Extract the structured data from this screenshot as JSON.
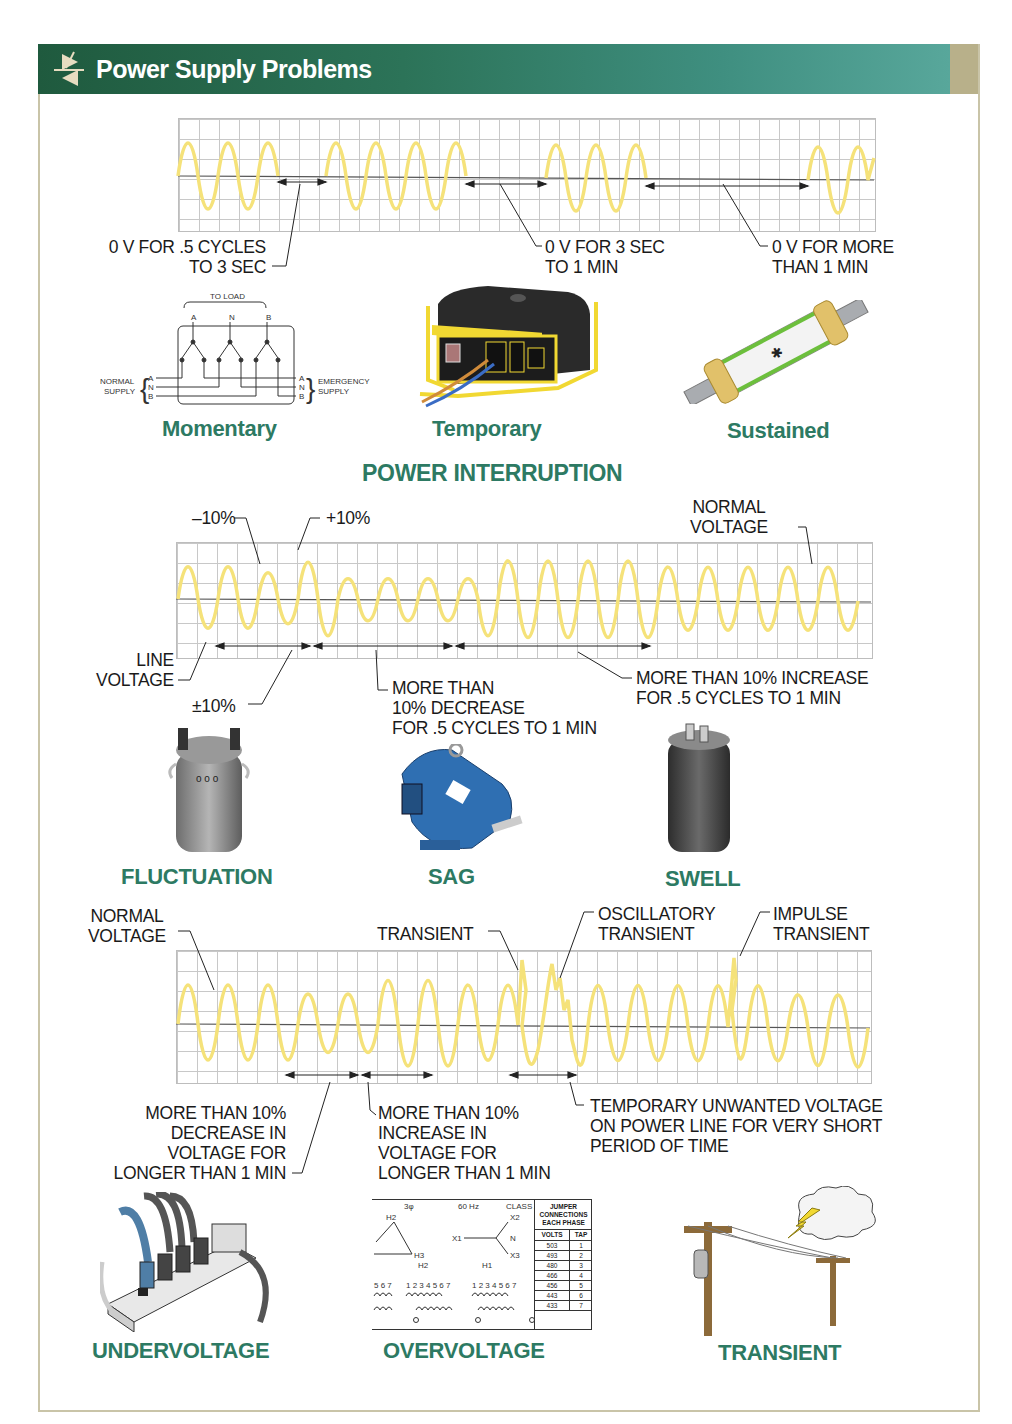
{
  "header": {
    "title": "Power Supply Problems",
    "icon": "thyristor-symbol-icon",
    "gradient_colors": [
      "#1f5a3e",
      "#58a79b"
    ],
    "accent_text_color": "#2d7a63",
    "waveform_color": "#f5e27a"
  },
  "interruption": {
    "annotations": {
      "momentary": "0 V FOR .5 CYCLES\nTO 3 SEC",
      "temporary": "0 V FOR 3 SEC\nTO 1 MIN",
      "sustained": "0 V FOR MORE\nTHAN 1 MIN"
    },
    "transfer_switch": {
      "to_load": "TO LOAD",
      "load_terminals": [
        "A",
        "N",
        "B"
      ],
      "normal_supply": "NORMAL\nSUPPLY",
      "emergency_supply": "EMERGENCY\nSUPPLY",
      "supply_terminals": [
        "A",
        "N",
        "B"
      ]
    },
    "captions": {
      "momentary": "Momentary",
      "temporary": "Temporary",
      "sustained": "Sustained"
    },
    "section_title": "POWER INTERRUPTION"
  },
  "voltage_variation": {
    "annotations": {
      "minus10": "–10%",
      "plus10": "+10%",
      "normal_voltage": "NORMAL\nVOLTAGE",
      "line_voltage": "LINE\nVOLTAGE",
      "plus_minus10": "±10%",
      "decrease": "MORE THAN\n10% DECREASE\nFOR .5 CYCLES TO 1 MIN",
      "increase": "MORE THAN 10% INCREASE\nFOR .5 CYCLES TO 1 MIN"
    },
    "captions": {
      "fluctuation": "FLUCTUATION",
      "sag": "SAG",
      "swell": "SWELL"
    }
  },
  "long_duration": {
    "annotations": {
      "normal_voltage": "NORMAL\nVOLTAGE",
      "transient": "TRANSIENT",
      "oscillatory": "OSCILLATORY\nTRANSIENT",
      "impulse": "IMPULSE\nTRANSIENT",
      "undervoltage_desc": "MORE THAN 10%\nDECREASE IN\nVOLTAGE FOR\nLONGER THAN 1 MIN",
      "overvoltage_desc": "MORE THAN 10%\nINCREASE IN\nVOLTAGE FOR\nLONGER THAN 1 MIN",
      "transient_desc": "TEMPORARY UNWANTED VOLTAGE\nON POWER LINE FOR VERY SHORT\nPERIOD OF TIME"
    },
    "nameplate": {
      "phase": "3φ",
      "frequency": "60 Hz",
      "class": "CLASS AA",
      "primary_terminals": [
        "H2",
        "H3"
      ],
      "secondary_terminals": [
        "X1",
        "X2",
        "X3",
        "N"
      ],
      "jumper_header": "JUMPER\nCONNECTIONS\nEACH PHASE",
      "col_volts": "VOLTS",
      "col_tap": "TAP",
      "rows": [
        {
          "volts": "503",
          "tap": "1"
        },
        {
          "volts": "493",
          "tap": "2"
        },
        {
          "volts": "480",
          "tap": "3"
        },
        {
          "volts": "466",
          "tap": "4"
        },
        {
          "volts": "456",
          "tap": "5"
        },
        {
          "volts": "443",
          "tap": "6"
        },
        {
          "volts": "433",
          "tap": "7"
        }
      ]
    },
    "captions": {
      "undervoltage": "UNDERVOLTAGE",
      "overvoltage": "OVERVOLTAGE",
      "transient": "TRANSIENT"
    }
  },
  "illustrations": [
    "transfer-switch-diagram",
    "portable-generator",
    "blown-fuse",
    "transformer-can",
    "blue-electric-motor",
    "capacitor",
    "power-strip",
    "transformer-nameplate",
    "utility-poles-lightning"
  ]
}
